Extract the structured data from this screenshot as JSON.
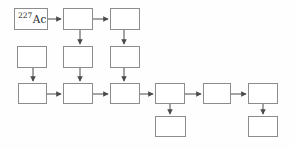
{
  "figure": {
    "kind": "flowchart-decay-chain",
    "start_node": {
      "mass_number": "227",
      "element_symbol": "Ac"
    },
    "colors": {
      "background": "#fefefe",
      "box_fill": "#ffffff",
      "box_border": "#8c8c8c",
      "arrow": "#4a4a4a",
      "text": "#2a2a2a"
    },
    "nodes": [
      {
        "id": "r1c1",
        "label": "227Ac"
      },
      {
        "id": "r1c2",
        "label": ""
      },
      {
        "id": "r1c3",
        "label": ""
      },
      {
        "id": "r2c1",
        "label": ""
      },
      {
        "id": "r2c2",
        "label": ""
      },
      {
        "id": "r2c3",
        "label": ""
      },
      {
        "id": "r3c1",
        "label": ""
      },
      {
        "id": "r3c2",
        "label": ""
      },
      {
        "id": "r3c3",
        "label": ""
      },
      {
        "id": "r3c4",
        "label": ""
      },
      {
        "id": "r3c5",
        "label": ""
      },
      {
        "id": "r3c6",
        "label": ""
      },
      {
        "id": "r4c1",
        "label": ""
      },
      {
        "id": "r4c2",
        "label": ""
      }
    ],
    "edges": [
      "r1c1->r1c2",
      "r1c2->r1c3",
      "r1c2->r2c2",
      "r1c3->r2c3",
      "r2c1->r3c1",
      "r2c2->r3c2",
      "r2c3->r3c3",
      "r3c1->r3c2",
      "r3c2->r3c3",
      "r3c3->r3c4",
      "r3c4->r3c5",
      "r3c5->r3c6",
      "r3c4->r4c1",
      "r3c6->r4c2"
    ]
  }
}
